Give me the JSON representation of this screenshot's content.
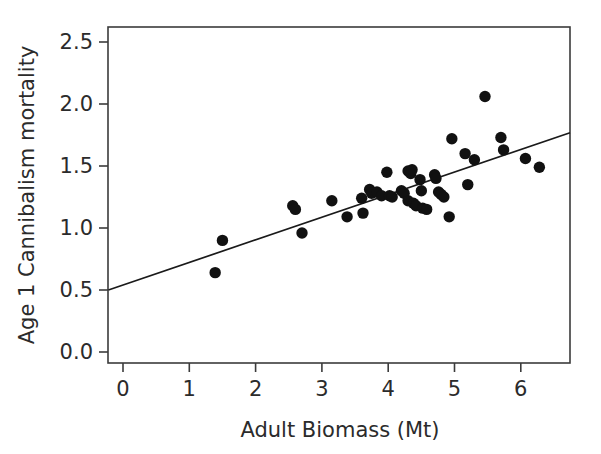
{
  "chart_data": {
    "type": "scatter",
    "title": "",
    "xlabel": "Adult Biomass (Mt)",
    "ylabel": "Age 1 Cannibalism mortality",
    "xlim": [
      -0.22,
      6.75
    ],
    "ylim": [
      -0.12,
      2.66
    ],
    "xticks": [
      0,
      1,
      2,
      3,
      4,
      5,
      6
    ],
    "yticks": [
      0.0,
      0.5,
      1.0,
      1.5,
      2.0,
      2.5
    ],
    "xtick_labels": [
      "0",
      "1",
      "2",
      "3",
      "4",
      "5",
      "6"
    ],
    "ytick_labels": [
      "0.0",
      "0.5",
      "1.0",
      "1.5",
      "2.0",
      "2.5"
    ],
    "grid": false,
    "legend": "none",
    "marker": "filled-circle",
    "marker_color": "#111111",
    "marker_size": 7,
    "points": [
      {
        "x": 1.39,
        "y": 0.64
      },
      {
        "x": 1.5,
        "y": 0.9
      },
      {
        "x": 2.56,
        "y": 1.18
      },
      {
        "x": 2.6,
        "y": 1.15
      },
      {
        "x": 2.7,
        "y": 0.96
      },
      {
        "x": 3.15,
        "y": 1.22
      },
      {
        "x": 3.38,
        "y": 1.09
      },
      {
        "x": 3.6,
        "y": 1.24
      },
      {
        "x": 3.62,
        "y": 1.12
      },
      {
        "x": 3.72,
        "y": 1.31
      },
      {
        "x": 3.75,
        "y": 1.28
      },
      {
        "x": 3.83,
        "y": 1.29
      },
      {
        "x": 3.9,
        "y": 1.26
      },
      {
        "x": 3.98,
        "y": 1.45
      },
      {
        "x": 4.02,
        "y": 1.26
      },
      {
        "x": 4.06,
        "y": 1.25
      },
      {
        "x": 4.2,
        "y": 1.3
      },
      {
        "x": 4.24,
        "y": 1.28
      },
      {
        "x": 4.3,
        "y": 1.46
      },
      {
        "x": 4.34,
        "y": 1.44
      },
      {
        "x": 4.36,
        "y": 1.47
      },
      {
        "x": 4.3,
        "y": 1.22
      },
      {
        "x": 4.38,
        "y": 1.2
      },
      {
        "x": 4.42,
        "y": 1.18
      },
      {
        "x": 4.48,
        "y": 1.39
      },
      {
        "x": 4.5,
        "y": 1.3
      },
      {
        "x": 4.52,
        "y": 1.16
      },
      {
        "x": 4.58,
        "y": 1.15
      },
      {
        "x": 4.7,
        "y": 1.43
      },
      {
        "x": 4.72,
        "y": 1.4
      },
      {
        "x": 4.76,
        "y": 1.29
      },
      {
        "x": 4.8,
        "y": 1.27
      },
      {
        "x": 4.84,
        "y": 1.25
      },
      {
        "x": 4.92,
        "y": 1.09
      },
      {
        "x": 4.96,
        "y": 1.72
      },
      {
        "x": 5.16,
        "y": 1.6
      },
      {
        "x": 5.2,
        "y": 1.35
      },
      {
        "x": 5.3,
        "y": 1.55
      },
      {
        "x": 5.46,
        "y": 2.06
      },
      {
        "x": 5.7,
        "y": 1.73
      },
      {
        "x": 5.74,
        "y": 1.63
      },
      {
        "x": 6.07,
        "y": 1.56
      },
      {
        "x": 6.28,
        "y": 1.49
      }
    ],
    "fit_line": {
      "type": "linear",
      "x_start": -0.22,
      "y_start": 0.5,
      "x_end": 6.75,
      "y_end": 1.77
    }
  }
}
